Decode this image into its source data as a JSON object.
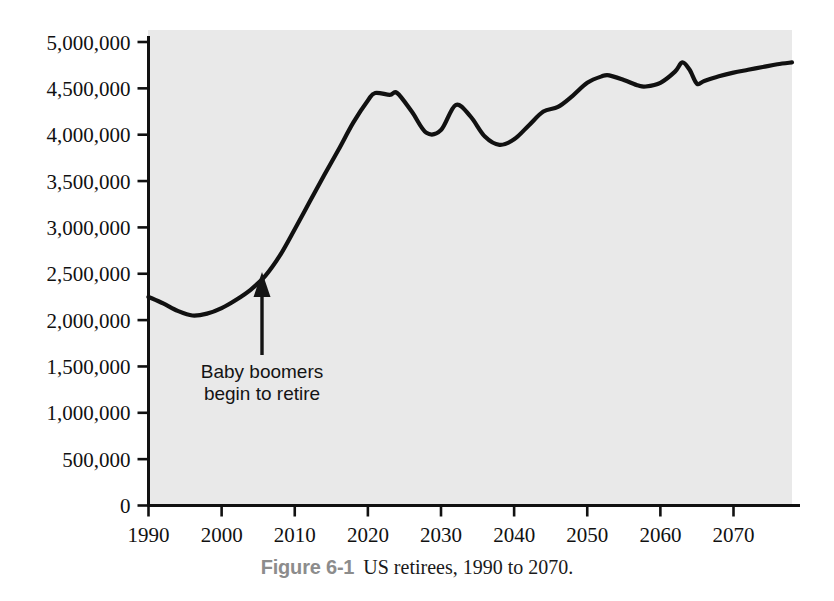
{
  "figure": {
    "caption_number": "Figure 6-1",
    "caption_title": "US retirees, 1990 to 2070.",
    "plot_background": "#e9e9e9",
    "line_color": "#111111",
    "axis_color": "#111111"
  },
  "annotation": {
    "line1": "Baby boomers",
    "line2": "begin to retire",
    "arrow_name": "up-arrow",
    "points_to_year": 2005
  },
  "axes": {
    "y_tick_labels": [
      "5,000,000",
      "4,500,000",
      "4,000,000",
      "3,500,000",
      "3,000,000",
      "2,500,000",
      "2,000,000",
      "1,500,000",
      "1,000,000",
      "500,000",
      "0"
    ],
    "x_tick_labels": [
      "1990",
      "2000",
      "2010",
      "2020",
      "2030",
      "2040",
      "2050",
      "2060",
      "2070"
    ]
  },
  "chart_data": {
    "type": "line",
    "title": "US retirees, 1990 to 2070.",
    "xlabel": "",
    "ylabel": "",
    "xlim": [
      1990,
      2078
    ],
    "ylim": [
      0,
      5000000
    ],
    "ytick_values": [
      0,
      500000,
      1000000,
      1500000,
      2000000,
      2500000,
      3000000,
      3500000,
      4000000,
      4500000,
      5000000
    ],
    "xtick_values": [
      1990,
      2000,
      2010,
      2020,
      2030,
      2040,
      2050,
      2060,
      2070
    ],
    "grid": false,
    "legend": null,
    "series": [
      {
        "name": "US retirees",
        "x": [
          1990,
          1992,
          1994,
          1996,
          1998,
          2000,
          2002,
          2004,
          2006,
          2008,
          2010,
          2012,
          2014,
          2016,
          2018,
          2020,
          2021,
          2023,
          2024,
          2026,
          2028,
          2030,
          2032,
          2034,
          2036,
          2038,
          2040,
          2042,
          2044,
          2046,
          2048,
          2050,
          2052,
          2053,
          2055,
          2057,
          2058,
          2060,
          2062,
          2063,
          2064,
          2065,
          2066,
          2068,
          2070,
          2072,
          2074,
          2076,
          2078
        ],
        "y": [
          2250000,
          2180000,
          2100000,
          2050000,
          2070000,
          2130000,
          2220000,
          2330000,
          2480000,
          2700000,
          2980000,
          3270000,
          3560000,
          3840000,
          4130000,
          4370000,
          4450000,
          4430000,
          4450000,
          4250000,
          4020000,
          4050000,
          4320000,
          4200000,
          3980000,
          3890000,
          3950000,
          4100000,
          4250000,
          4300000,
          4420000,
          4560000,
          4630000,
          4640000,
          4590000,
          4530000,
          4520000,
          4560000,
          4680000,
          4780000,
          4700000,
          4550000,
          4580000,
          4630000,
          4670000,
          4700000,
          4730000,
          4760000,
          4780000
        ]
      }
    ],
    "annotations": [
      {
        "text": "Baby boomers begin to retire",
        "x": 2005,
        "y": 2480000,
        "type": "arrow-callout"
      }
    ]
  }
}
